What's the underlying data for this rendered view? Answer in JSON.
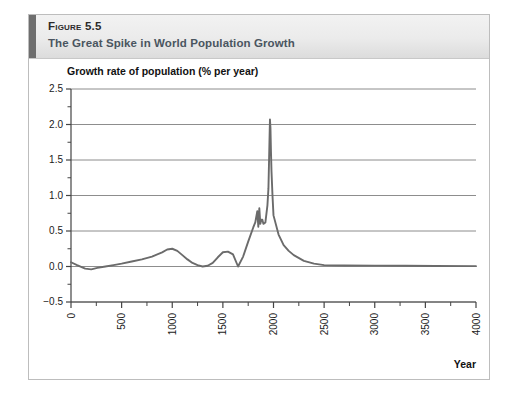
{
  "figure": {
    "number_label": "Figure 5.5",
    "subtitle": "The Great Spike in World Population Growth"
  },
  "chart_data": {
    "type": "line",
    "title": "The Great Spike in World Population Growth",
    "xlabel": "Year",
    "ylabel": "Growth rate of population (% per year)",
    "xlim": [
      0,
      4000
    ],
    "ylim": [
      -0.5,
      2.5
    ],
    "grid": true,
    "legend": null,
    "x_ticks": [
      0,
      500,
      1000,
      1500,
      2000,
      2500,
      3000,
      3500,
      4000
    ],
    "x_tick_labels": [
      "0",
      "500",
      "1000",
      "1500",
      "2000",
      "2500",
      "3000",
      "3500",
      "4000"
    ],
    "x_minor_step": 250,
    "y_ticks": [
      -0.5,
      0.0,
      0.5,
      1.0,
      1.5,
      2.0,
      2.5
    ],
    "y_tick_labels": [
      "-0.5",
      "0.0",
      "0.5",
      "1.0",
      "1.5",
      "2.0",
      "2.5"
    ],
    "y_minor_step": 0.25,
    "series": [
      {
        "name": "Growth rate of population",
        "color": "#6b6b6b",
        "x": [
          0,
          60,
          140,
          200,
          260,
          340,
          420,
          500,
          600,
          700,
          800,
          900,
          950,
          1000,
          1050,
          1100,
          1150,
          1200,
          1250,
          1300,
          1350,
          1400,
          1450,
          1500,
          1550,
          1600,
          1650,
          1700,
          1750,
          1800,
          1820,
          1840,
          1850,
          1860,
          1870,
          1880,
          1890,
          1900,
          1920,
          1940,
          1950,
          1960,
          1965,
          1970,
          1975,
          1980,
          1990,
          2000,
          2050,
          2100,
          2150,
          2200,
          2300,
          2400,
          2500,
          2700,
          3000,
          3300,
          3600,
          4000
        ],
        "y": [
          0.06,
          0.02,
          -0.03,
          -0.04,
          -0.02,
          0.0,
          0.02,
          0.04,
          0.07,
          0.1,
          0.14,
          0.2,
          0.24,
          0.25,
          0.22,
          0.16,
          0.1,
          0.05,
          0.02,
          0.0,
          0.01,
          0.05,
          0.13,
          0.2,
          0.21,
          0.17,
          0.0,
          0.14,
          0.35,
          0.55,
          0.62,
          0.78,
          0.56,
          0.82,
          0.6,
          0.66,
          0.66,
          0.6,
          0.62,
          0.86,
          1.1,
          1.75,
          2.07,
          1.95,
          1.62,
          1.35,
          1.0,
          0.72,
          0.45,
          0.3,
          0.22,
          0.16,
          0.08,
          0.04,
          0.02,
          0.015,
          0.012,
          0.01,
          0.008,
          0.005
        ]
      }
    ]
  }
}
